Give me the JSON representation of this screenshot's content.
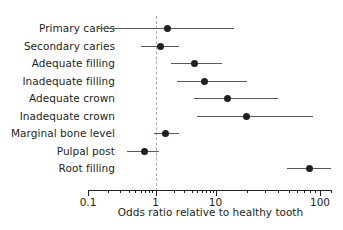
{
  "chart_data": {
    "type": "scatter",
    "subtype": "forest-plot",
    "title": "",
    "xlabel": "Odds ratio relative to healthy tooth",
    "ylabel": "",
    "xscale": "log",
    "xlim": [
      0.1,
      130
    ],
    "grid": false,
    "legend": null,
    "reference_line": {
      "value": 1,
      "style": "dashed",
      "color": "#b0a9a0"
    },
    "axis": {
      "tick_labels": [
        "0.1",
        "1",
        "10",
        "100"
      ],
      "tick_values": [
        0.1,
        1,
        10,
        100
      ],
      "minor_ticks": true
    },
    "categories": [
      "Primary caries",
      "Secondary caries",
      "Adequate filling",
      "Inadequate filling",
      "Adequate crown",
      "Inadequate crown",
      "Marginal bone level",
      "Pulpal post",
      "Root filling"
    ],
    "points": [
      {
        "label": "Primary caries",
        "odds_ratio": 1.6,
        "ci_low": 0.14,
        "ci_high": 15.0
      },
      {
        "label": "Secondary caries",
        "odds_ratio": 1.2,
        "ci_low": 0.6,
        "ci_high": 2.5
      },
      {
        "label": "Adequate filling",
        "odds_ratio": 4.5,
        "ci_low": 1.8,
        "ci_high": 11.5
      },
      {
        "label": "Inadequate filling",
        "odds_ratio": 6.5,
        "ci_low": 2.3,
        "ci_high": 20.0
      },
      {
        "label": "Adequate crown",
        "odds_ratio": 13.0,
        "ci_low": 4.3,
        "ci_high": 40.0
      },
      {
        "label": "Inadequate crown",
        "odds_ratio": 20.0,
        "ci_low": 5.0,
        "ci_high": 85.0
      },
      {
        "label": "Marginal bone level",
        "odds_ratio": 1.45,
        "ci_low": 0.95,
        "ci_high": 2.5
      },
      {
        "label": "Pulpal post",
        "odds_ratio": 0.68,
        "ci_low": 0.38,
        "ci_high": 1.15
      },
      {
        "label": "Root filling",
        "odds_ratio": 80.0,
        "ci_low": 48.0,
        "ci_high": 128.0
      }
    ],
    "colors": {
      "point": "#231f20",
      "ci_line": "#58595b",
      "reference_line": "#b0a9a0",
      "axis": "#231f20",
      "text": "#231f20",
      "background": "#ffffff"
    }
  }
}
